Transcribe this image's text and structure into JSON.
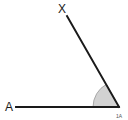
{
  "diagram": {
    "type": "angle-diagram",
    "background_color": "#ffffff",
    "stroke_color": "#1a1a1a",
    "sector_fill_color": "#d2d2d2",
    "sector_stroke_color": "#9a9a9a",
    "labels": {
      "ray_upper_label": "X",
      "ray_horizontal_label": "A",
      "vertex_label": "1A"
    },
    "geometry": {
      "vertex": {
        "x": 119,
        "y": 107
      },
      "horizontal_ray_end": {
        "x": 16,
        "y": 107
      },
      "upper_ray_end": {
        "x": 67,
        "y": 16
      },
      "arc_radius": 26,
      "angle_degrees": 119
    }
  }
}
